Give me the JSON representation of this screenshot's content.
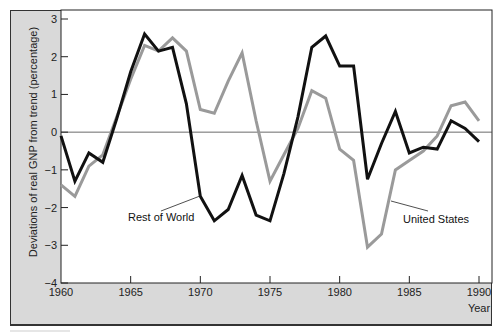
{
  "chart_data": {
    "type": "line",
    "title": "",
    "xlabel": "Year",
    "ylabel": "Deviations of real GNP from trend (percentage)",
    "xlim": [
      1960,
      1990
    ],
    "ylim": [
      -4,
      3
    ],
    "x_ticks": [
      1960,
      1965,
      1970,
      1975,
      1980,
      1985,
      1990
    ],
    "y_ticks": [
      3,
      2,
      1,
      0,
      -1,
      -2,
      -3,
      -4
    ],
    "y_tick_labels": [
      "3",
      "2",
      "1",
      "0",
      "−1",
      "−2",
      "−3",
      "−4"
    ],
    "grid": false,
    "reference_line": 0,
    "x": [
      1960,
      1961,
      1962,
      1963,
      1964,
      1965,
      1966,
      1967,
      1968,
      1969,
      1970,
      1971,
      1972,
      1973,
      1974,
      1975,
      1976,
      1977,
      1978,
      1979,
      1980,
      1981,
      1982,
      1983,
      1984,
      1985,
      1986,
      1987,
      1988,
      1989,
      1990
    ],
    "series": [
      {
        "name": "Rest of World",
        "color": "#111111",
        "values": [
          -0.1,
          -1.3,
          -0.55,
          -0.8,
          0.35,
          1.6,
          2.6,
          2.15,
          2.25,
          0.75,
          -1.7,
          -2.35,
          -2.05,
          -1.15,
          -2.2,
          -2.35,
          -1.1,
          0.4,
          2.25,
          2.55,
          1.75,
          1.75,
          -1.25,
          -0.3,
          0.55,
          -0.55,
          -0.4,
          -0.45,
          0.3,
          0.1,
          -0.25
        ]
      },
      {
        "name": "United States",
        "color": "#9a9a9a",
        "values": [
          -1.4,
          -1.7,
          -0.9,
          -0.6,
          0.4,
          1.4,
          2.3,
          2.15,
          2.5,
          2.15,
          0.6,
          0.5,
          1.35,
          2.1,
          0.3,
          -1.3,
          -0.6,
          0.1,
          1.1,
          0.9,
          -0.45,
          -0.75,
          -3.05,
          -2.7,
          -1.0,
          -0.75,
          -0.5,
          -0.1,
          0.7,
          0.8,
          0.3
        ]
      }
    ],
    "annotations": [
      {
        "text": "Rest of World",
        "series": "Rest of World"
      },
      {
        "text": "United States",
        "series": "United States"
      }
    ],
    "legend_position": "inline-annotations"
  },
  "colors": {
    "panel": "#d9d9d9",
    "plot_bg": "#ffffff",
    "axis": "#222222"
  }
}
